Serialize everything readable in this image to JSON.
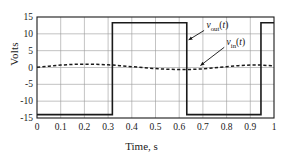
{
  "chart_data": {
    "type": "line",
    "title": "",
    "xlabel": "Time, s",
    "ylabel": "Volts",
    "xlim": [
      0,
      1
    ],
    "ylim": [
      -15,
      15
    ],
    "grid": true,
    "xticks": [
      "0",
      "0.1",
      "0.2",
      "0.3",
      "0.4",
      "0.5",
      "0.6",
      "0.7",
      "0.8",
      "0.9",
      "1"
    ],
    "xtick_values": [
      0,
      0.1,
      0.2,
      0.3,
      0.4,
      0.5,
      0.6,
      0.7,
      0.8,
      0.9,
      1
    ],
    "yticks": [
      "15",
      "10",
      "5",
      "0",
      "-5",
      "-10",
      "-15"
    ],
    "ytick_values": [
      15,
      10,
      5,
      0,
      -5,
      -10,
      -15
    ],
    "legend_position": "inside-right",
    "series": [
      {
        "name": "v_out(t)",
        "label_main": "v",
        "label_sub": "out",
        "label_arg": "(t)",
        "style": "solid",
        "color": "#1a1a1a",
        "width": 1.6,
        "type": "square-wave",
        "high_value": 13.3,
        "low_value": -14.0,
        "transitions": [
          {
            "t": 0.0,
            "level": -14.0
          },
          {
            "t": 0.318,
            "level": 13.3
          },
          {
            "t": 0.632,
            "level": -14.0
          },
          {
            "t": 0.945,
            "level": 13.3
          },
          {
            "t": 1.0,
            "level": 13.3
          }
        ],
        "points": [
          [
            0.0,
            -14.0
          ],
          [
            0.318,
            -14.0
          ],
          [
            0.318,
            13.3
          ],
          [
            0.632,
            13.3
          ],
          [
            0.632,
            -14.0
          ],
          [
            0.945,
            -14.0
          ],
          [
            0.945,
            13.3
          ],
          [
            1.0,
            13.3
          ]
        ]
      },
      {
        "name": "v_in(t)",
        "label_main": "v",
        "label_sub": "in",
        "label_arg": "(t)",
        "style": "dashed",
        "color": "#1a1a1a",
        "width": 1.5,
        "type": "sine",
        "amplitude": 1.0,
        "period": 1.0,
        "phase_deg": 0,
        "points": [
          [
            0.0,
            0.05
          ],
          [
            0.05,
            0.4
          ],
          [
            0.1,
            0.72
          ],
          [
            0.15,
            0.92
          ],
          [
            0.2,
            1.0
          ],
          [
            0.25,
            0.95
          ],
          [
            0.3,
            0.8
          ],
          [
            0.32,
            0.72
          ],
          [
            0.35,
            0.55
          ],
          [
            0.4,
            0.25
          ],
          [
            0.45,
            -0.05
          ],
          [
            0.5,
            -0.32
          ],
          [
            0.55,
            -0.52
          ],
          [
            0.6,
            -0.62
          ],
          [
            0.63,
            -0.62
          ],
          [
            0.65,
            -0.58
          ],
          [
            0.7,
            -0.4
          ],
          [
            0.75,
            -0.1
          ],
          [
            0.8,
            0.25
          ],
          [
            0.85,
            0.55
          ],
          [
            0.9,
            0.72
          ],
          [
            0.945,
            0.72
          ],
          [
            0.95,
            0.7
          ],
          [
            1.0,
            0.45
          ]
        ]
      }
    ],
    "annotations": [
      {
        "name": "vout-callout",
        "text": "v_out(t)",
        "label_x": 0.715,
        "label_y": 12.2,
        "arrow_from": [
          0.705,
          11.0
        ],
        "arrow_to": [
          0.64,
          8.2
        ]
      },
      {
        "name": "vin-callout",
        "text": "v_in(t)",
        "label_x": 0.8,
        "label_y": 7.2,
        "arrow_from": [
          0.79,
          6.0
        ],
        "arrow_to": [
          0.69,
          0.6
        ]
      }
    ]
  },
  "axes": {
    "ylabel": "Volts",
    "xlabel_text": "Time, s",
    "frame_color": "#1a1a1a",
    "grid_color": "#9a9a9a"
  }
}
